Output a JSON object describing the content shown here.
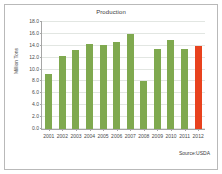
{
  "figure": {
    "source_note": "Source:USDA",
    "frame_color": "#b9b9b9",
    "background": "#ffffff"
  },
  "chart_data": {
    "type": "bar",
    "title": "Production",
    "xlabel": "",
    "ylabel": "Million Tons",
    "categories": [
      "2001",
      "2002",
      "2003",
      "2004",
      "2005",
      "2006",
      "2007",
      "2008",
      "2009",
      "2010",
      "2011",
      "2012"
    ],
    "values": [
      9.3,
      12.3,
      13.3,
      14.3,
      14.1,
      14.6,
      16.0,
      8.0,
      13.4,
      15.0,
      13.5,
      14.0
    ],
    "bar_colors": [
      "#7FA94F",
      "#7FA94F",
      "#7FA94F",
      "#7FA94F",
      "#7FA94F",
      "#7FA94F",
      "#7FA94F",
      "#7FA94F",
      "#7FA94F",
      "#7FA94F",
      "#7FA94F",
      "#E8421E"
    ],
    "ylim": [
      0.0,
      18.0
    ],
    "ytick_labels": [
      "18.0",
      "16.0",
      "14.0",
      "12.0",
      "10.0",
      "8.0",
      "6.0",
      "4.0",
      "2.0",
      "0.0"
    ],
    "ytick_values": [
      18.0,
      16.0,
      14.0,
      12.0,
      10.0,
      8.0,
      6.0,
      4.0,
      2.0,
      0.0
    ],
    "grid": true,
    "legend": false,
    "series_color_default": "#7FA94F",
    "series_color_highlight": "#E8421E"
  }
}
